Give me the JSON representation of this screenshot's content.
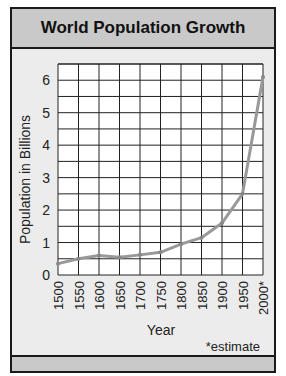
{
  "header": {
    "title": "World Population Growth"
  },
  "footnote": "*estimate",
  "chart_data": {
    "type": "line",
    "title": "World Population Growth",
    "xlabel": "Year",
    "ylabel": "Population in Billions",
    "categories": [
      "1500",
      "1550",
      "1600",
      "1650",
      "1700",
      "1750",
      "1800",
      "1850",
      "1900",
      "1950",
      "2000*"
    ],
    "x": [
      1500,
      1550,
      1600,
      1650,
      1700,
      1750,
      1800,
      1850,
      1900,
      1950,
      2000
    ],
    "values": [
      0.35,
      0.5,
      0.6,
      0.55,
      0.62,
      0.7,
      0.95,
      1.15,
      1.6,
      2.5,
      6.1
    ],
    "yticks": [
      0,
      1,
      2,
      3,
      4,
      5,
      6
    ],
    "ylim": [
      0,
      6.5
    ],
    "grid": true,
    "grid_y_step": 0.5,
    "legend": null,
    "annotations": [
      "*estimate"
    ],
    "line_color": "#999999",
    "grid_color": "#222222"
  }
}
